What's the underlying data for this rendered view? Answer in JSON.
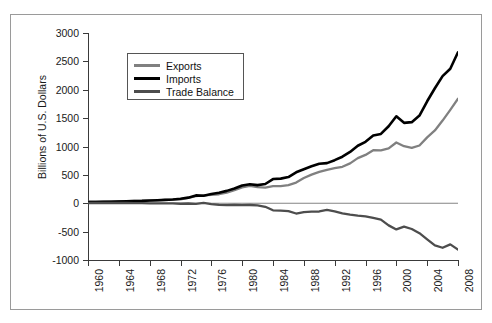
{
  "chart_data": {
    "type": "line",
    "title": "",
    "xlabel": "",
    "ylabel": "Billions of U.S. Dollars",
    "xlim": [
      1960,
      2008
    ],
    "ylim": [
      -1000,
      3000
    ],
    "yticks": [
      3000,
      2500,
      2000,
      1500,
      1000,
      500,
      0,
      -500,
      -1000
    ],
    "ytick_labels": [
      "3000",
      "2500",
      "2000",
      "1500",
      "1000",
      "500",
      "0",
      "-500",
      "-1000"
    ],
    "xticks": [
      1960,
      1964,
      1968,
      1972,
      1976,
      1980,
      1984,
      1988,
      1992,
      1996,
      2000,
      2004,
      2008
    ],
    "xtick_labels": [
      "1960",
      "1964",
      "1968",
      "1972",
      "1976",
      "1980",
      "1984",
      "1988",
      "1992",
      "1996",
      "2000",
      "2004",
      "2008"
    ],
    "grid": false,
    "legend_position": "upper-left-inside",
    "x": [
      1960,
      1961,
      1962,
      1963,
      1964,
      1965,
      1966,
      1967,
      1968,
      1969,
      1970,
      1971,
      1972,
      1973,
      1974,
      1975,
      1976,
      1977,
      1978,
      1979,
      1980,
      1981,
      1982,
      1983,
      1984,
      1985,
      1986,
      1987,
      1988,
      1989,
      1990,
      1991,
      1992,
      1993,
      1994,
      1995,
      1996,
      1997,
      1998,
      1999,
      2000,
      2001,
      2002,
      2003,
      2004,
      2005,
      2006,
      2007,
      2008
    ],
    "series": [
      {
        "name": "Exports",
        "color": "#808080",
        "values": [
          26,
          27,
          29,
          31,
          35,
          37,
          40,
          43,
          47,
          51,
          59,
          63,
          70,
          95,
          126,
          138,
          149,
          159,
          186,
          231,
          281,
          305,
          284,
          277,
          302,
          303,
          321,
          364,
          444,
          504,
          552,
          590,
          617,
          643,
          703,
          795,
          852,
          935,
          933,
          966,
          1071,
          1005,
          975,
          1018,
          1161,
          1283,
          1457,
          1646,
          1843
        ]
      },
      {
        "name": "Imports",
        "color": "#000000",
        "values": [
          22,
          23,
          25,
          27,
          29,
          33,
          38,
          41,
          49,
          54,
          60,
          66,
          79,
          99,
          138,
          133,
          163,
          186,
          218,
          259,
          314,
          336,
          320,
          339,
          426,
          434,
          461,
          545,
          600,
          651,
          697,
          707,
          759,
          820,
          904,
          1013,
          1083,
          1194,
          1222,
          1356,
          1532,
          1417,
          1429,
          1545,
          1797,
          2026,
          2241,
          2370,
          2660
        ]
      },
      {
        "name": "Trade Balance",
        "color": "#4d4d4d",
        "values": [
          4,
          4,
          4,
          4,
          6,
          4,
          2,
          2,
          -2,
          -3,
          -1,
          -3,
          -9,
          -4,
          -12,
          5,
          -14,
          -27,
          -32,
          -28,
          -33,
          -31,
          -36,
          -62,
          -124,
          -131,
          -140,
          -181,
          -156,
          -147,
          -145,
          -117,
          -142,
          -177,
          -201,
          -218,
          -231,
          -259,
          -289,
          -390,
          -461,
          -412,
          -454,
          -527,
          -636,
          -743,
          -784,
          -724,
          -817
        ]
      }
    ],
    "legend": [
      {
        "label": "Exports",
        "color": "#808080",
        "thickness": 2.4
      },
      {
        "label": "Imports",
        "color": "#000000",
        "thickness": 3.0
      },
      {
        "label": "Trade Balance",
        "color": "#4d4d4d",
        "thickness": 2.8
      }
    ]
  }
}
